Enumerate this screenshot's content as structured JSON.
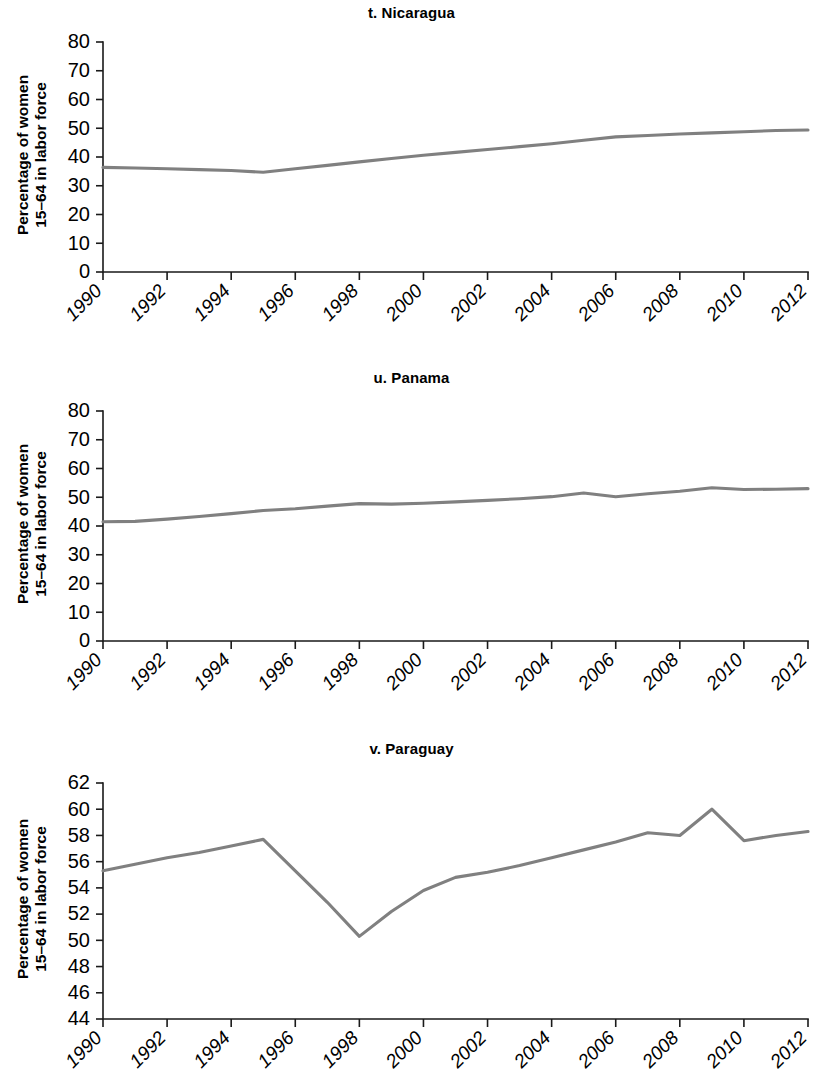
{
  "figure": {
    "y_axis_title_line1": "Percentage of women",
    "y_axis_title_line2": "15–64 in labor force",
    "line_color": "#808080",
    "axis_color": "#1a1a1a"
  },
  "panels": [
    {
      "title": "t. Nicaragua"
    },
    {
      "title": "u. Panama"
    },
    {
      "title": "v. Paraguay"
    }
  ],
  "chart_data": [
    {
      "type": "line",
      "title": "t. Nicaragua",
      "xlabel": "",
      "ylabel": "Percentage of women 15–64 in labor force",
      "xlim": [
        1990,
        2012
      ],
      "ylim": [
        0,
        80
      ],
      "grid": false,
      "legend": "none",
      "xticks": [
        1990,
        1992,
        1994,
        1996,
        1998,
        2000,
        2002,
        2004,
        2006,
        2008,
        2010,
        2012
      ],
      "xtick_labels": [
        "1990",
        "1992",
        "1994",
        "1996",
        "1998",
        "2000",
        "2002",
        "2004",
        "2006",
        "2008",
        "2010",
        "2012"
      ],
      "yticks": [
        0,
        10,
        20,
        30,
        40,
        50,
        60,
        70,
        80
      ],
      "ytick_labels": [
        "0",
        "10",
        "20",
        "30",
        "40",
        "50",
        "60",
        "70",
        "80"
      ],
      "x": [
        1990,
        1991,
        1992,
        1993,
        1994,
        1995,
        1996,
        1997,
        1998,
        1999,
        2000,
        2001,
        2002,
        2003,
        2004,
        2005,
        2006,
        2007,
        2008,
        2009,
        2010,
        2011,
        2012
      ],
      "values": [
        36.4,
        36.2,
        35.9,
        35.6,
        35.3,
        34.7,
        35.9,
        37.1,
        38.3,
        39.5,
        40.6,
        41.6,
        42.6,
        43.6,
        44.6,
        45.8,
        47.0,
        47.5,
        48.0,
        48.4,
        48.8,
        49.2,
        49.4
      ]
    },
    {
      "type": "line",
      "title": "u. Panama",
      "xlabel": "",
      "ylabel": "Percentage of women 15–64 in labor force",
      "xlim": [
        1990,
        2012
      ],
      "ylim": [
        0,
        80
      ],
      "grid": false,
      "legend": "none",
      "xticks": [
        1990,
        1992,
        1994,
        1996,
        1998,
        2000,
        2002,
        2004,
        2006,
        2008,
        2010,
        2012
      ],
      "xtick_labels": [
        "1990",
        "1992",
        "1994",
        "1996",
        "1998",
        "2000",
        "2002",
        "2004",
        "2006",
        "2008",
        "2010",
        "2012"
      ],
      "yticks": [
        0,
        10,
        20,
        30,
        40,
        50,
        60,
        70,
        80
      ],
      "ytick_labels": [
        "0",
        "10",
        "20",
        "30",
        "40",
        "50",
        "60",
        "70",
        "80"
      ],
      "x": [
        1990,
        1991,
        1992,
        1993,
        1994,
        1995,
        1996,
        1997,
        1998,
        1999,
        2000,
        2001,
        2002,
        2003,
        2004,
        2005,
        2006,
        2007,
        2008,
        2009,
        2010,
        2011,
        2012
      ],
      "values": [
        41.5,
        41.6,
        42.4,
        43.3,
        44.3,
        45.4,
        46.0,
        46.9,
        47.8,
        47.6,
        47.9,
        48.4,
        48.9,
        49.5,
        50.2,
        51.5,
        50.2,
        51.2,
        52.1,
        53.3,
        52.7,
        52.8,
        53.0
      ]
    },
    {
      "type": "line",
      "title": "v. Paraguay",
      "xlabel": "",
      "ylabel": "Percentage of women 15–64 in labor force",
      "xlim": [
        1990,
        2012
      ],
      "ylim": [
        44,
        62
      ],
      "grid": false,
      "legend": "none",
      "xticks": [
        1990,
        1992,
        1994,
        1996,
        1998,
        2000,
        2002,
        2004,
        2006,
        2008,
        2010,
        2012
      ],
      "xtick_labels": [
        "1990",
        "1992",
        "1994",
        "1996",
        "1998",
        "2000",
        "2002",
        "2004",
        "2006",
        "2008",
        "2010",
        "2012"
      ],
      "yticks": [
        44,
        46,
        48,
        50,
        52,
        54,
        56,
        58,
        60,
        62
      ],
      "ytick_labels": [
        "44",
        "46",
        "48",
        "50",
        "52",
        "54",
        "56",
        "58",
        "60",
        "62"
      ],
      "x": [
        1990,
        1991,
        1992,
        1993,
        1994,
        1995,
        1996,
        1997,
        1998,
        1999,
        2000,
        2001,
        2002,
        2003,
        2004,
        2005,
        2006,
        2007,
        2008,
        2009,
        2010,
        2011,
        2012
      ],
      "values": [
        55.3,
        55.8,
        56.3,
        56.7,
        57.2,
        57.7,
        55.3,
        52.9,
        50.3,
        52.2,
        53.8,
        54.8,
        55.2,
        55.7,
        56.3,
        56.9,
        57.5,
        58.2,
        58.0,
        60.0,
        57.6,
        58.0,
        58.3
      ]
    }
  ]
}
